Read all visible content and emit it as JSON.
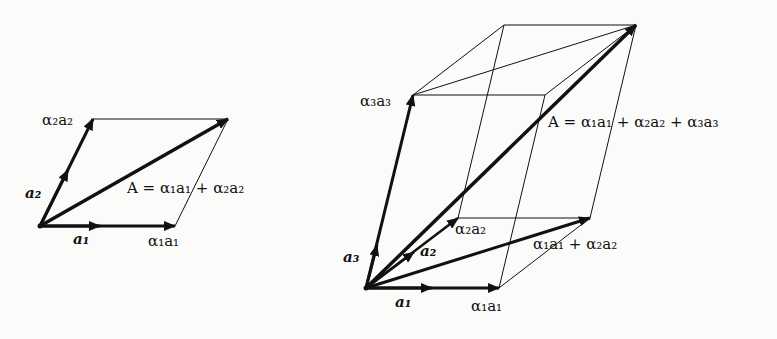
{
  "diagram": {
    "figures": [
      {
        "id": "plane",
        "type": "parallelogram",
        "labels": {
          "a1": "a₁",
          "a2": "a₂",
          "alpha1_a1": "α₁a₁",
          "alpha2_a2": "α₂a₂",
          "A_eq": "A = α₁a₁ + α₂a₂"
        }
      },
      {
        "id": "space",
        "type": "parallelepiped",
        "labels": {
          "a1": "a₁",
          "a2": "a₂",
          "a3": "a₃",
          "alpha1_a1": "α₁a₁",
          "alpha2_a2": "α₂a₂",
          "alpha3_a3": "α₃a₃",
          "sum12": "α₁a₁ + α₂a₂",
          "A_eq": "A = α₁a₁ + α₂a₂ + α₃a₃"
        }
      }
    ],
    "colors": {
      "ink": "#111111",
      "background": "#fbfbf9"
    }
  }
}
